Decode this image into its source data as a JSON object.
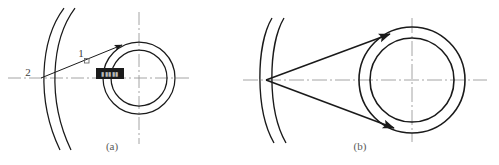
{
  "figure": {
    "background_color": "#ffffff",
    "line_color": "#1a1a1a",
    "centerline_color": "#9a9a9a",
    "label_color": "#3c3c3c",
    "caption_color": "#5a5a5a",
    "width": 499,
    "height": 165
  },
  "panels": [
    {
      "id": "panel-a",
      "caption": "(a)",
      "caption_x": 112,
      "caption_y": 150,
      "description": "Single tangent line drawn from reference point 2 on the arc to the outer circle of the ring, with reference point 1 marked along the line",
      "arc": {
        "name": "left-arc-pair",
        "outer_path": "M 64 8 C 40 40, 36 100, 60 150",
        "inner_path": "M 75 8 C 51 40, 47 100, 71 150"
      },
      "ring": {
        "name": "concentric-ring",
        "center_x": 139,
        "center_y": 78,
        "outer_radius": 36,
        "inner_radius": 28
      },
      "centerlines": {
        "horizontal": {
          "x1": 8,
          "y1": 78,
          "x2": 190,
          "y2": 78
        },
        "vertical": {
          "x1": 139,
          "y1": 12,
          "x2": 139,
          "y2": 144
        }
      },
      "tangent_line": {
        "name": "tangent-line-1",
        "x1": 41,
        "y1": 78,
        "x2": 122,
        "y2": 45,
        "has_arrowhead": true
      },
      "markers": [
        {
          "name": "reference-point-1",
          "label": "1",
          "label_x": 81,
          "label_y": 57,
          "tick_x": 87,
          "tick_y": 61
        },
        {
          "name": "reference-point-2",
          "label": "2",
          "label_x": 28,
          "label_y": 76
        }
      ],
      "redacted_label": {
        "name": "redacted-annotation-box",
        "x": 96,
        "y": 68,
        "width": 28,
        "height": 11,
        "fill": "#1b1b1b",
        "text": "▮▮▮▮▮"
      }
    },
    {
      "id": "panel-b",
      "caption": "(b)",
      "caption_x": 360,
      "caption_y": 150,
      "description": "Two tangent lines drawn from an apex point on the arc to the outer circle of the concentric ring",
      "arc": {
        "name": "left-arc-pair",
        "outer_path": "M 272 18 C 256 45, 255 110, 274 143",
        "inner_path": "M 284 18 C 268 45, 267 110, 286 143"
      },
      "ring": {
        "name": "concentric-ring",
        "center_x": 412,
        "center_y": 80,
        "outer_radius": 53,
        "inner_radius": 42
      },
      "centerlines": {
        "horizontal": {
          "x1": 243,
          "y1": 80,
          "x2": 487,
          "y2": 80
        },
        "vertical": {
          "x1": 412,
          "y1": 18,
          "x2": 412,
          "y2": 142
        }
      },
      "apex": {
        "name": "tangent-apex-point",
        "x": 266,
        "y": 80
      },
      "tangent_lines": [
        {
          "name": "tangent-line-upper",
          "x1": 266,
          "y1": 80,
          "x2": 390,
          "y2": 34,
          "has_arrowhead": true
        },
        {
          "name": "tangent-line-lower",
          "x1": 266,
          "y1": 80,
          "x2": 394,
          "y2": 128,
          "has_arrowhead": true
        }
      ]
    }
  ]
}
